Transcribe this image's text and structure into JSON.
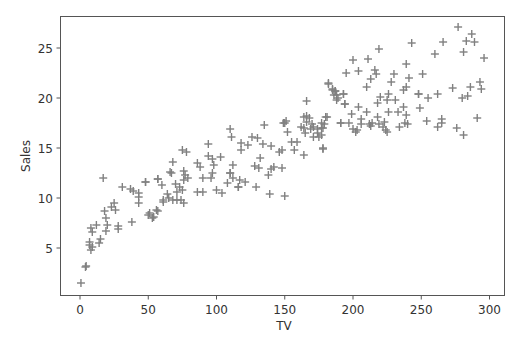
{
  "chart_data": {
    "type": "scatter",
    "title": "",
    "xlabel": "TV",
    "ylabel": "Sales",
    "xlim": [
      -15,
      310
    ],
    "ylim": [
      0.3,
      28.2
    ],
    "xticks": [
      0,
      50,
      100,
      150,
      200,
      250,
      300
    ],
    "yticks": [
      5,
      10,
      15,
      20,
      25
    ],
    "grid": false,
    "legend": null,
    "marker": "+",
    "marker_color": "#808080",
    "points": [
      [
        0.7,
        1.5
      ],
      [
        4.5,
        3.2
      ],
      [
        4,
        3.1
      ],
      [
        17,
        12
      ],
      [
        31,
        11.1
      ],
      [
        37,
        10.9
      ],
      [
        39,
        10.7
      ],
      [
        48,
        11.6
      ],
      [
        57,
        11.9
      ],
      [
        43,
        10.5
      ],
      [
        43,
        10.1
      ],
      [
        43,
        9.5
      ],
      [
        61,
        9.8
      ],
      [
        51,
        8.5
      ],
      [
        54,
        8.1
      ],
      [
        57,
        8.7
      ],
      [
        38,
        7.6
      ],
      [
        25,
        9.5
      ],
      [
        26,
        8.8
      ],
      [
        23,
        9.1
      ],
      [
        18,
        8.7
      ],
      [
        19,
        8.0
      ],
      [
        20,
        7.3
      ],
      [
        19,
        6.7
      ],
      [
        28,
        7.2
      ],
      [
        28,
        6.9
      ],
      [
        12,
        7.3
      ],
      [
        8,
        7.0
      ],
      [
        9,
        6.6
      ],
      [
        7,
        5.6
      ],
      [
        7,
        5.3
      ],
      [
        9,
        5.1
      ],
      [
        8,
        4.8
      ],
      [
        14,
        5.5
      ],
      [
        15,
        5.9
      ],
      [
        110,
        16.9
      ],
      [
        111,
        16.1
      ],
      [
        94,
        15.4
      ],
      [
        75,
        14.8
      ],
      [
        78,
        14.6
      ],
      [
        68,
        13.6
      ],
      [
        94,
        14.2
      ],
      [
        97,
        13.9
      ],
      [
        103,
        14.1
      ],
      [
        86,
        13.5
      ],
      [
        88,
        13.1
      ],
      [
        98,
        13.3
      ],
      [
        66,
        12.6
      ],
      [
        67,
        12.5
      ],
      [
        76,
        12.7
      ],
      [
        77,
        12.3
      ],
      [
        79,
        12.0
      ],
      [
        76,
        11.8
      ],
      [
        97,
        12.5
      ],
      [
        96,
        12.0
      ],
      [
        90,
        12.0
      ],
      [
        110,
        12.5
      ],
      [
        57,
        11.9
      ],
      [
        48,
        11.6
      ],
      [
        70,
        11.4
      ],
      [
        73,
        11.1
      ],
      [
        71,
        10.6
      ],
      [
        75,
        10.8
      ],
      [
        108,
        11.5
      ],
      [
        86,
        10.6
      ],
      [
        90,
        10.6
      ],
      [
        100,
        10.8
      ],
      [
        104,
        10.5
      ],
      [
        116,
        11.1
      ],
      [
        60,
        11.3
      ],
      [
        64,
        10.4
      ],
      [
        65,
        10.0
      ],
      [
        61,
        9.6
      ],
      [
        56,
        8.8
      ],
      [
        50,
        8.3
      ],
      [
        53,
        8.0
      ],
      [
        68,
        9.8
      ],
      [
        71,
        9.8
      ],
      [
        74,
        9.8
      ],
      [
        76,
        9.5
      ],
      [
        135,
        17.3
      ],
      [
        149,
        17.5
      ],
      [
        152,
        16.6
      ],
      [
        164,
        18.1
      ],
      [
        166,
        17.6
      ],
      [
        164,
        17.0
      ],
      [
        118,
        14.8
      ],
      [
        118,
        15.5
      ],
      [
        126,
        16.1
      ],
      [
        123,
        15.3
      ],
      [
        112,
        13.3
      ],
      [
        130,
        16.0
      ],
      [
        134,
        15.4
      ],
      [
        146,
        14.6
      ],
      [
        140,
        15.2
      ],
      [
        132,
        14.0
      ],
      [
        128,
        13.2
      ],
      [
        142,
        13.1
      ],
      [
        140,
        12.9
      ],
      [
        131,
        13.0
      ],
      [
        110,
        12.5
      ],
      [
        112,
        12.0
      ],
      [
        117,
        11.8
      ],
      [
        121,
        11.6
      ],
      [
        138,
        12.3
      ],
      [
        116,
        11.1
      ],
      [
        129,
        11.1
      ],
      [
        139,
        10.4
      ],
      [
        150,
        10.2
      ],
      [
        165,
        16.5
      ],
      [
        171,
        16.1
      ],
      [
        178,
        17.0
      ],
      [
        157,
        14.8
      ],
      [
        164,
        14.3
      ],
      [
        148,
        13.0
      ],
      [
        159,
        15.6
      ],
      [
        182,
        21.4
      ],
      [
        185,
        20.9
      ],
      [
        187,
        20.7
      ],
      [
        188,
        20.3
      ],
      [
        189,
        20.0
      ],
      [
        193,
        20.4
      ],
      [
        194,
        19.4
      ],
      [
        166,
        19.7
      ],
      [
        180,
        18.1
      ],
      [
        191,
        17.5
      ],
      [
        150,
        17.5
      ],
      [
        151,
        17.7
      ],
      [
        166,
        18.2
      ],
      [
        170,
        17.4
      ],
      [
        171,
        17.1
      ],
      [
        168,
        18.0
      ],
      [
        169,
        16.9
      ],
      [
        162,
        17.1
      ],
      [
        174,
        16.5
      ],
      [
        175,
        16.1
      ],
      [
        177,
        17.0
      ],
      [
        174,
        16.9
      ],
      [
        179,
        17.4
      ],
      [
        155,
        15.6
      ],
      [
        178,
        15.0
      ],
      [
        148,
        14.8
      ],
      [
        243,
        25.5
      ],
      [
        219,
        24.9
      ],
      [
        200,
        23.8
      ],
      [
        211,
        23.9
      ],
      [
        239,
        23.4
      ],
      [
        195,
        22.5
      ],
      [
        204,
        22.7
      ],
      [
        216,
        22.8
      ],
      [
        217,
        22.4
      ],
      [
        230,
        22.4
      ],
      [
        228,
        21.6
      ],
      [
        213,
        21.9
      ],
      [
        241,
        22.0
      ],
      [
        210,
        21.1
      ],
      [
        239,
        21.1
      ],
      [
        237,
        20.8
      ],
      [
        182,
        21.5
      ],
      [
        185,
        20.8
      ],
      [
        187,
        20.7
      ],
      [
        186,
        20.3
      ],
      [
        188,
        19.8
      ],
      [
        193,
        20.4
      ],
      [
        194,
        19.4
      ],
      [
        226,
        20.4
      ],
      [
        225,
        19.8
      ],
      [
        231,
        19.8
      ],
      [
        220,
        20.1
      ],
      [
        218,
        19.5
      ],
      [
        248,
        20.4
      ],
      [
        204,
        19.1
      ],
      [
        199,
        18.4
      ],
      [
        210,
        18.6
      ],
      [
        226,
        18.6
      ],
      [
        233,
        18.6
      ],
      [
        237,
        19.1
      ],
      [
        239,
        18.3
      ],
      [
        181,
        18.1
      ],
      [
        191,
        17.5
      ],
      [
        206,
        17.9
      ],
      [
        206,
        17.4
      ],
      [
        218,
        18.1
      ],
      [
        214,
        17.5
      ],
      [
        213,
        17.2
      ],
      [
        222,
        17.1
      ],
      [
        197,
        17.5
      ],
      [
        200,
        16.9
      ],
      [
        202,
        16.6
      ],
      [
        203,
        16.8
      ],
      [
        212,
        17.4
      ],
      [
        219,
        17.4
      ],
      [
        223,
        17.6
      ],
      [
        224,
        16.8
      ],
      [
        225,
        16.6
      ],
      [
        234,
        17.1
      ],
      [
        238,
        17.5
      ],
      [
        240,
        17.4
      ],
      [
        177,
        17.5
      ],
      [
        177,
        16.3
      ],
      [
        178,
        14.9
      ],
      [
        277,
        27.1
      ],
      [
        287,
        26.4
      ],
      [
        283,
        25.7
      ],
      [
        289,
        25.6
      ],
      [
        266,
        25.6
      ],
      [
        260,
        24.4
      ],
      [
        281,
        24.6
      ],
      [
        296,
        24.0
      ],
      [
        251,
        22.4
      ],
      [
        273,
        21.0
      ],
      [
        286,
        21.1
      ],
      [
        293,
        21.6
      ],
      [
        294,
        20.9
      ],
      [
        248,
        20.4
      ],
      [
        255,
        20.0
      ],
      [
        262,
        20.4
      ],
      [
        280,
        20.0
      ],
      [
        284,
        20.2
      ],
      [
        249,
        19.0
      ],
      [
        254,
        17.7
      ],
      [
        265,
        17.9
      ],
      [
        265,
        17.5
      ],
      [
        262,
        17.1
      ],
      [
        291,
        18.0
      ],
      [
        276,
        17.0
      ],
      [
        281,
        16.3
      ]
    ]
  }
}
